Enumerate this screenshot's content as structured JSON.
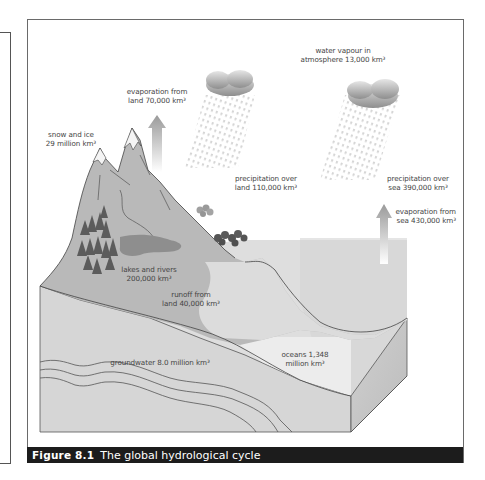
{
  "figure": {
    "number": "Figure 8.1",
    "title": "The global hydrological cycle"
  },
  "labels": {
    "water_vapour": {
      "line1": "water vapour in",
      "line2": "atmosphere 13,000 km³"
    },
    "evap_land": {
      "line1": "evaporation from",
      "line2": "land 70,000 km³"
    },
    "snow_ice": {
      "line1": "snow and ice",
      "line2": "29 million km³"
    },
    "precip_land": {
      "line1": "precipitation over",
      "line2": "land 110,000 km³"
    },
    "precip_sea": {
      "line1": "precipitation over",
      "line2": "sea 390,000 km³"
    },
    "evap_sea": {
      "line1": "evaporation from",
      "line2": "sea 430,000 km³"
    },
    "lakes_rivers": {
      "line1": "lakes and rivers",
      "line2": "200,000 km³"
    },
    "runoff": {
      "line1": "runoff from",
      "line2": "land 40,000 km³"
    },
    "groundwater": {
      "line1": "groundwater 8.0 million km³"
    },
    "oceans": {
      "line1": "oceans 1,348",
      "line2": "million km³"
    }
  },
  "colors": {
    "caption_bg": "#1c1c1c",
    "land": "#b8b8b8",
    "sea_top": "#dcdcdc",
    "front_face": "#d4d4d4",
    "ocean_front": "#e9e9e9",
    "side_face": "#c6c6c6",
    "lake": "#8c8c8c",
    "trees": "#5a5a5a"
  }
}
